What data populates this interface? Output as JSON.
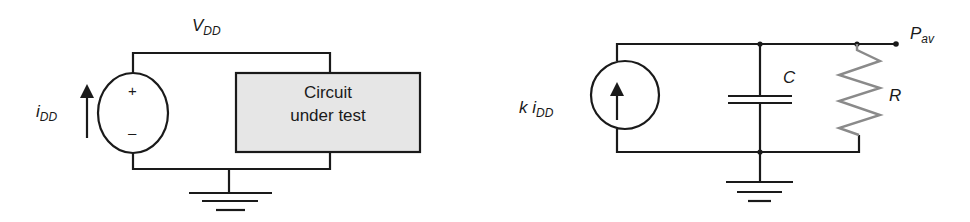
{
  "figure": {
    "left_circuit": {
      "supply_label_main": "V",
      "supply_label_sub": "DD",
      "current_label_main": "i",
      "current_label_sub": "DD",
      "source_plus": "+",
      "source_minus": "–",
      "box_line1": "Circuit",
      "box_line2": "under test",
      "box_fill": "#e6e6e6"
    },
    "right_circuit": {
      "source_label_prefix": "k i",
      "source_label_sub": "DD",
      "capacitor_label": "C",
      "resistor_label": "R",
      "output_label_main": "P",
      "output_label_sub": "av",
      "resistor_color": "#8a8a8a"
    },
    "colors": {
      "wire": "#1a1a1a",
      "background": "#ffffff"
    }
  }
}
